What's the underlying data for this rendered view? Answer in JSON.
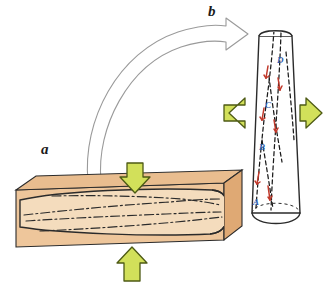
{
  "figure": {
    "background_color": "#ffffff"
  },
  "panels": [
    {
      "key": "a",
      "label": "a",
      "name": "panel-a-sawn-beam",
      "description": "Rectangular sawn timber beam containing an embedded tapered log, loaded in compression"
    },
    {
      "key": "b",
      "label": "b",
      "name": "panel-b-tapered-log",
      "description": "Upright tapered log loaded in tension with dashed grain lines and red slip markers"
    }
  ],
  "point_labels": [
    {
      "id": "A",
      "label": "A",
      "color": "#2a5db0"
    },
    {
      "id": "B",
      "label": "B",
      "color": "#2a5db0"
    },
    {
      "id": "C",
      "label": "C",
      "color": "#2a5db0"
    },
    {
      "id": "D",
      "label": "D",
      "color": "#2a5db0"
    }
  ],
  "arrows": {
    "load_arrows": [
      {
        "name": "compression-arrow-top",
        "direction": "down",
        "panel": "a"
      },
      {
        "name": "compression-arrow-bottom",
        "direction": "up",
        "panel": "a"
      },
      {
        "name": "tension-arrow-left",
        "direction": "left",
        "panel": "b"
      },
      {
        "name": "tension-arrow-right",
        "direction": "right",
        "panel": "b"
      }
    ],
    "transition_arrow": {
      "name": "curved-transition-arrow",
      "from_panel": "a",
      "to_panel": "b",
      "style": "outlined-white-curved"
    }
  },
  "colors": {
    "wood_face": "#eec69b",
    "wood_top": "#e8b98a",
    "wood_end": "#e0ab76",
    "log_fill": "#f3d7b4",
    "outline": "#2b2b2b",
    "arrow_fill": "#d2e05a",
    "arrow_stroke": "#4d5a14",
    "slip_marker": "#c1392b",
    "label_blue": "#2a5db0",
    "curve_arrow_stroke": "#9a9a9a"
  }
}
